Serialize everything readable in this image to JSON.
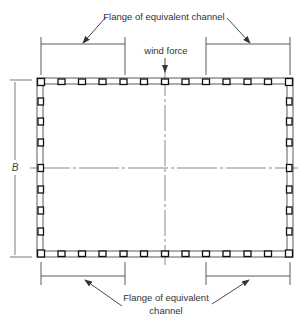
{
  "diagram": {
    "type": "structural cross-section",
    "labels": {
      "top_flange": "Flange of equivalent channel",
      "wind": "wind force",
      "dimension_b": "B",
      "bottom_flange_line1": "Flange of equivalent",
      "bottom_flange_line2": "channel"
    },
    "frame": {
      "columns_per_long_side": 13,
      "columns_per_short_side": 9,
      "stroke_color": "#222222"
    }
  }
}
